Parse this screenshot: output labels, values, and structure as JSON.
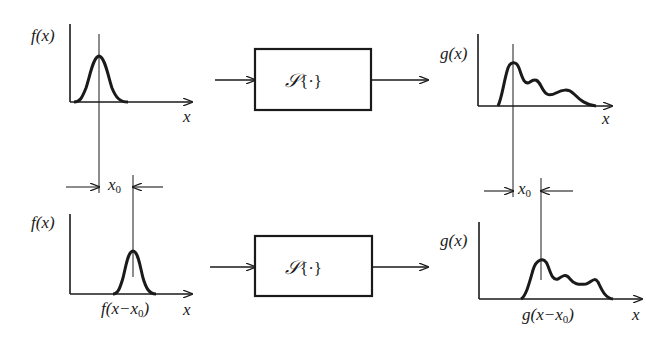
{
  "diagram": {
    "colors": {
      "ink": "#1a1a1a",
      "background": "#ffffff"
    },
    "top_row": {
      "input_plot": {
        "ylabel": "f(x)",
        "xlabel": "x",
        "curve": "gaussian centered at origin reference line"
      },
      "system": {
        "label_symbol": "𝒮",
        "label_arg": "{·}"
      },
      "output_plot": {
        "ylabel": "g(x)",
        "xlabel": "x",
        "curve": "tall peak followed by two decaying bumps"
      }
    },
    "shift": {
      "left_label_main": "x",
      "left_label_sub": "0",
      "right_label_main": "x",
      "right_label_sub": "0"
    },
    "bottom_row": {
      "input_plot": {
        "ylabel": "f(x)",
        "xlabel": "x",
        "caption_main": "f(x−x",
        "caption_sub": "0",
        "caption_end": ")"
      },
      "system": {
        "label_symbol": "𝒮",
        "label_arg": "{·}"
      },
      "output_plot": {
        "ylabel": "g(x)",
        "xlabel": "x",
        "caption_main": "g(x−x",
        "caption_sub": "0",
        "caption_end": ")"
      }
    }
  }
}
